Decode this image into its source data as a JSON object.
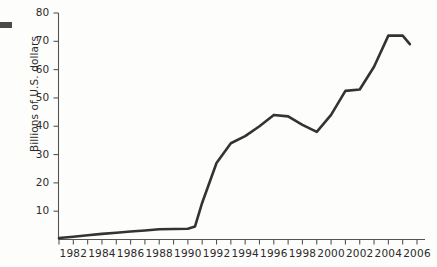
{
  "figure": {
    "background_color": "#fdfdfb",
    "ink_color": "#333333",
    "artifact": {
      "name": "page-edge-mark",
      "color": "#4a4a4a"
    }
  },
  "chart_data": {
    "type": "line",
    "title": "",
    "xlabel": "",
    "ylabel": "Billions of U.S. dollars",
    "xlim": [
      1981,
      2006
    ],
    "ylim": [
      0,
      80
    ],
    "grid": false,
    "legend": null,
    "line_color": "#333333",
    "line_width": 2.6,
    "y_ticks": [
      10,
      20,
      30,
      40,
      50,
      60,
      70,
      80
    ],
    "y_tick_labels": [
      "10",
      "20",
      "30",
      "40",
      "50",
      "60",
      "70",
      "80"
    ],
    "x_ticks": [
      1981,
      1982,
      1983,
      1984,
      1985,
      1986,
      1987,
      1988,
      1989,
      1990,
      1991,
      1992,
      1993,
      1994,
      1995,
      1996,
      1997,
      1998,
      1999,
      2000,
      2001,
      2002,
      2003,
      2004,
      2005,
      2006
    ],
    "x_tick_labels": [
      "1982",
      "1984",
      "1986",
      "1988",
      "1990",
      "1992",
      "1994",
      "1996",
      "1998",
      "2000",
      "2002",
      "2004",
      "2006"
    ],
    "x_labeled_ticks": [
      1982,
      1984,
      1986,
      1988,
      1990,
      1992,
      1994,
      1996,
      1998,
      2000,
      2002,
      2004,
      2006
    ],
    "x": [
      1981,
      1982,
      1983,
      1984,
      1985,
      1986,
      1987,
      1988,
      1989,
      1990,
      1990.5,
      1991,
      1992,
      1993,
      1994,
      1995,
      1996,
      1997,
      1998,
      1999,
      2000,
      2001,
      2002,
      2003,
      2004,
      2005,
      2005.5
    ],
    "values": [
      0.5,
      1.0,
      1.5,
      2.0,
      2.4,
      2.8,
      3.2,
      3.6,
      3.7,
      3.8,
      4.6,
      13.0,
      27.0,
      34.0,
      36.5,
      40.0,
      44.0,
      43.5,
      40.5,
      38.0,
      44.0,
      52.5,
      53.0,
      61.0,
      72.0,
      72.0,
      69.0
    ],
    "series_name": ""
  },
  "axes": {
    "y_axis_name": "y-axis",
    "x_axis_name": "x-axis"
  }
}
